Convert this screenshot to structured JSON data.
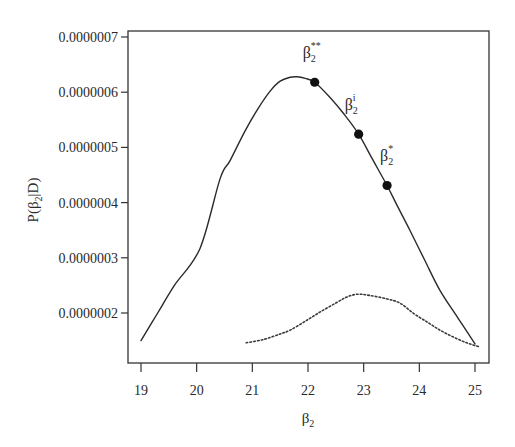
{
  "chart_data": {
    "type": "line",
    "title": "",
    "xlabel": "β2",
    "ylabel": "P(β2|D)",
    "xlim": [
      18.8,
      25.25
    ],
    "ylim": [
      1.2e-07,
      7.1e-07
    ],
    "grid": false,
    "legend": null,
    "x_ticks": [
      19,
      20,
      21,
      22,
      23,
      24,
      25
    ],
    "x_tick_labels": [
      "19",
      "20",
      "21",
      "22",
      "23",
      "24",
      "25"
    ],
    "y_ticks": [
      2e-07,
      3e-07,
      4e-07,
      5e-07,
      6e-07,
      7e-07
    ],
    "y_tick_labels": [
      "0.0000002",
      "0.0000003",
      "0.0000004",
      "0.0000005",
      "0.0000006",
      "0.0000007"
    ],
    "series": [
      {
        "name": "posterior (solid)",
        "style": "solid",
        "color": "#2a2a2a",
        "x": [
          19.0,
          19.3,
          19.6,
          20.06,
          20.42,
          20.6,
          20.87,
          21.1,
          21.32,
          21.5,
          21.68,
          21.8,
          21.95,
          22.12,
          22.4,
          22.65,
          22.91,
          23.15,
          23.42,
          23.6,
          23.83,
          24.1,
          24.37,
          24.7,
          25.0
        ],
        "y": [
          1.5e-07,
          2e-07,
          2.5e-07,
          3.17e-07,
          4.43e-07,
          4.76e-07,
          5.3e-07,
          5.7e-07,
          6.02e-07,
          6.2e-07,
          6.27e-07,
          6.28e-07,
          6.25e-07,
          6.18e-07,
          5.9e-07,
          5.6e-07,
          5.24e-07,
          4.8e-07,
          4.31e-07,
          3.95e-07,
          3.5e-07,
          2.95e-07,
          2.41e-07,
          1.9e-07,
          1.44e-07
        ]
      },
      {
        "name": "posterior (dotted)",
        "style": "dotted",
        "color": "#3a3a3a",
        "x": [
          20.89,
          21.2,
          21.5,
          21.68,
          21.95,
          22.22,
          22.5,
          22.7,
          22.88,
          23.1,
          23.4,
          23.65,
          23.9,
          24.15,
          24.37,
          24.6,
          24.85,
          25.07
        ],
        "y": [
          1.46e-07,
          1.52e-07,
          1.62e-07,
          1.69e-07,
          1.85e-07,
          2.02e-07,
          2.18e-07,
          2.29e-07,
          2.34e-07,
          2.32e-07,
          2.26e-07,
          2.18e-07,
          1.99e-07,
          1.83e-07,
          1.69e-07,
          1.57e-07,
          1.46e-07,
          1.39e-07
        ]
      }
    ],
    "annotations": [
      {
        "label": "β2**",
        "base": "β",
        "sub": "2",
        "sup": "**",
        "x": 22.12,
        "y": 6.18e-07
      },
      {
        "label": "β2i",
        "base": "β",
        "sub": "2",
        "sup": "i",
        "x": 22.91,
        "y": 5.24e-07
      },
      {
        "label": "β2*",
        "base": "β",
        "sub": "2",
        "sup": "*",
        "x": 23.42,
        "y": 4.31e-07
      }
    ]
  },
  "axes": {
    "x_label_base": "β",
    "x_label_sub": "2",
    "y_label_prefix": "P(β",
    "y_label_sub": "2",
    "y_label_suffix": "|D)"
  }
}
